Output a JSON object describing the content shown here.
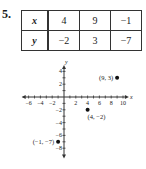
{
  "problem": {
    "number": "5."
  },
  "table": {
    "rows": [
      {
        "header": "x",
        "values": [
          "4",
          "9",
          "−1"
        ]
      },
      {
        "header": "y",
        "values": [
          "−2",
          "3",
          "−7"
        ]
      }
    ]
  },
  "chart_data": {
    "type": "scatter",
    "title": "",
    "xlabel": "x",
    "ylabel": "y",
    "x": [
      4,
      9,
      -1
    ],
    "y": [
      -2,
      3,
      -7
    ],
    "point_labels": [
      "(4, −2)",
      "(9, 3)",
      "(−1, −7)"
    ],
    "xlim": [
      -7,
      11
    ],
    "ylim": [
      -9,
      5
    ],
    "x_tick_labels": [
      "−6",
      "−4",
      "−2",
      "2",
      "4",
      "6",
      "8",
      "10"
    ],
    "y_tick_labels": [
      "4",
      "2",
      "−2",
      "−4",
      "−6",
      "−8"
    ],
    "grid": false,
    "legend": null
  }
}
